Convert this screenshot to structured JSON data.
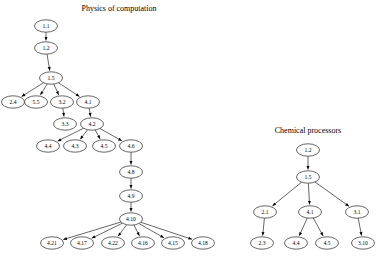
{
  "figure": {
    "background_color": "#ffffff",
    "stroke_color": "#000000",
    "node_fill": "#ffffff"
  },
  "graphs": [
    {
      "id": "physics-of-computation",
      "title": "Physics of computation",
      "title_pos": {
        "x": 119,
        "y": 11
      },
      "nodes": [
        {
          "id": "L1",
          "label": "1.1",
          "x": 46,
          "y": 26
        },
        {
          "id": "L2",
          "label": "1.2",
          "x": 46,
          "y": 48
        },
        {
          "id": "L3",
          "label": "1.5",
          "x": 51,
          "y": 78
        },
        {
          "id": "L4",
          "label": "2.4",
          "x": 13,
          "y": 102
        },
        {
          "id": "L5",
          "label": "5.5",
          "x": 36,
          "y": 102
        },
        {
          "id": "L6",
          "label": "3.2",
          "x": 62,
          "y": 102
        },
        {
          "id": "L7",
          "label": "4.1",
          "x": 88,
          "y": 102
        },
        {
          "id": "L8",
          "label": "3.3",
          "x": 65,
          "y": 124
        },
        {
          "id": "L9",
          "label": "4.2",
          "x": 92,
          "y": 124
        },
        {
          "id": "L10",
          "label": "4.4",
          "x": 48,
          "y": 146
        },
        {
          "id": "L11",
          "label": "4.3",
          "x": 75,
          "y": 146
        },
        {
          "id": "L12",
          "label": "4.5",
          "x": 104,
          "y": 146
        },
        {
          "id": "L13",
          "label": "4.6",
          "x": 131,
          "y": 146
        },
        {
          "id": "L14",
          "label": "4.8",
          "x": 131,
          "y": 172
        },
        {
          "id": "L15",
          "label": "4.9",
          "x": 131,
          "y": 196
        },
        {
          "id": "L16",
          "label": "4.10",
          "x": 131,
          "y": 219
        },
        {
          "id": "L17",
          "label": "4.21",
          "x": 52,
          "y": 243
        },
        {
          "id": "L18",
          "label": "4.17",
          "x": 82,
          "y": 243
        },
        {
          "id": "L19",
          "label": "4.22",
          "x": 113,
          "y": 243
        },
        {
          "id": "L20",
          "label": "4.16",
          "x": 143,
          "y": 243
        },
        {
          "id": "L21",
          "label": "4.15",
          "x": 173,
          "y": 243
        },
        {
          "id": "L22",
          "label": "4.18",
          "x": 203,
          "y": 243
        }
      ],
      "edges": [
        {
          "from": "L1",
          "to": "L2"
        },
        {
          "from": "L2",
          "to": "L3"
        },
        {
          "from": "L3",
          "to": "L4"
        },
        {
          "from": "L3",
          "to": "L5"
        },
        {
          "from": "L3",
          "to": "L6"
        },
        {
          "from": "L3",
          "to": "L7"
        },
        {
          "from": "L6",
          "to": "L8"
        },
        {
          "from": "L7",
          "to": "L9"
        },
        {
          "from": "L9",
          "to": "L10"
        },
        {
          "from": "L9",
          "to": "L11"
        },
        {
          "from": "L9",
          "to": "L12"
        },
        {
          "from": "L9",
          "to": "L13"
        },
        {
          "from": "L13",
          "to": "L14"
        },
        {
          "from": "L14",
          "to": "L15"
        },
        {
          "from": "L15",
          "to": "L16"
        },
        {
          "from": "L16",
          "to": "L17"
        },
        {
          "from": "L16",
          "to": "L18"
        },
        {
          "from": "L16",
          "to": "L19"
        },
        {
          "from": "L16",
          "to": "L20"
        },
        {
          "from": "L16",
          "to": "L21"
        },
        {
          "from": "L16",
          "to": "L22"
        }
      ]
    },
    {
      "id": "chemical-processors",
      "title": "Chemical processors",
      "title_pos": {
        "x": 308,
        "y": 133
      },
      "nodes": [
        {
          "id": "R1",
          "label": "1.2",
          "x": 308,
          "y": 150
        },
        {
          "id": "R2",
          "label": "1.5",
          "x": 308,
          "y": 177
        },
        {
          "id": "R3",
          "label": "2.1",
          "x": 265,
          "y": 212
        },
        {
          "id": "R4",
          "label": "4.1",
          "x": 310,
          "y": 212
        },
        {
          "id": "R5",
          "label": "3.1",
          "x": 357,
          "y": 212
        },
        {
          "id": "R6",
          "label": "2.3",
          "x": 262,
          "y": 243
        },
        {
          "id": "R7",
          "label": "4.4",
          "x": 296,
          "y": 243
        },
        {
          "id": "R8",
          "label": "4.5",
          "x": 327,
          "y": 243
        },
        {
          "id": "R9",
          "label": "3.10",
          "x": 363,
          "y": 243
        }
      ],
      "edges": [
        {
          "from": "R1",
          "to": "R2"
        },
        {
          "from": "R2",
          "to": "R3"
        },
        {
          "from": "R2",
          "to": "R4"
        },
        {
          "from": "R2",
          "to": "R5"
        },
        {
          "from": "R3",
          "to": "R6"
        },
        {
          "from": "R4",
          "to": "R7"
        },
        {
          "from": "R4",
          "to": "R8"
        },
        {
          "from": "R5",
          "to": "R9"
        }
      ]
    }
  ]
}
